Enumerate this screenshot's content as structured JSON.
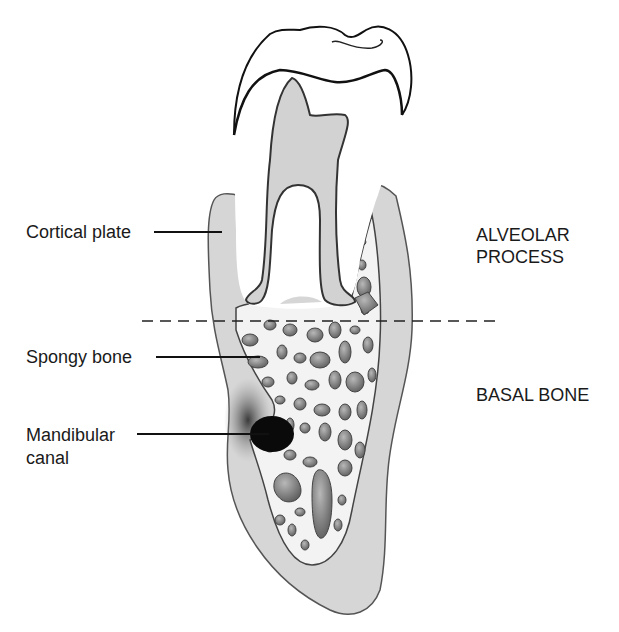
{
  "diagram": {
    "labels": {
      "cortical_plate": "Cortical plate",
      "spongy_bone": "Spongy bone",
      "mandibular_canal_line1": "Mandibular",
      "mandibular_canal_line2": "canal",
      "alveolar_line1": "ALVEOLAR",
      "alveolar_line2": "PROCESS",
      "basal_bone": "BASAL BONE"
    },
    "colors": {
      "background": "#ffffff",
      "cortical_bone": "#d4d4d4",
      "spongy_bone_fill": "#f2f2f2",
      "trabecular_spaces": "#8c8c8c",
      "tooth": "#ffffff",
      "pulp": "#d0d0d0",
      "canal": "#0a0a0a",
      "outline": "#333333"
    },
    "divider": {
      "style": "dashed",
      "y": 321
    }
  }
}
